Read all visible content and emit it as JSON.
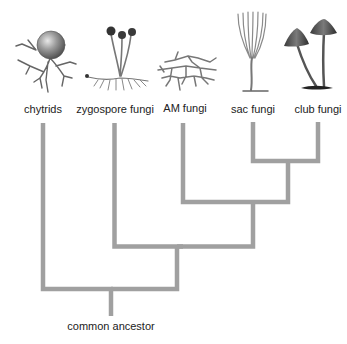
{
  "diagram": {
    "type": "cladogram",
    "root_label": "common ancestor",
    "line_color": "#a0a0a0",
    "taxa": [
      {
        "id": "chytrids",
        "label": "chytrids",
        "icon": "chytrid-illustration-icon"
      },
      {
        "id": "zygospore",
        "label": "zygospore fungi",
        "icon": "zygospore-fungi-illustration-icon"
      },
      {
        "id": "am",
        "label": "AM fungi",
        "icon": "am-fungi-illustration-icon"
      },
      {
        "id": "sac",
        "label": "sac fungi",
        "icon": "sac-fungi-illustration-icon"
      },
      {
        "id": "club",
        "label": "club fungi",
        "icon": "club-fungi-illustration-icon"
      }
    ],
    "topology": "(chytrids,(zygospore fungi,(AM fungi,(sac fungi,club fungi))))"
  }
}
